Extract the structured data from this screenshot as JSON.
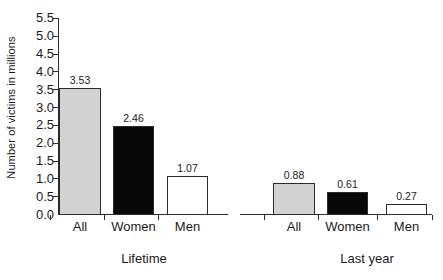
{
  "chart_data": {
    "type": "bar",
    "title": "",
    "subtitle": "",
    "xlabel": "",
    "ylabel": "Number of victims in millions",
    "ylim": [
      0.0,
      5.5
    ],
    "yticks": [
      "0.0",
      "0.5",
      "1.0",
      "1.5",
      "2.0",
      "2.5",
      "3.0",
      "3.5",
      "4.0",
      "4.5",
      "5.0",
      "5.5"
    ],
    "ytick_values": [
      0.0,
      0.5,
      1.0,
      1.5,
      2.0,
      2.5,
      3.0,
      3.5,
      4.0,
      4.5,
      5.0,
      5.5
    ],
    "grid": false,
    "legend": "none",
    "groups": [
      {
        "name": "Lifetime",
        "categories": [
          "All",
          "Women",
          "Men"
        ],
        "values": [
          3.53,
          2.46,
          1.07
        ],
        "labels": [
          "3.53",
          "2.46",
          "1.07"
        ],
        "fills": [
          "gray",
          "black",
          "white"
        ]
      },
      {
        "name": "Last year",
        "categories": [
          "All",
          "Women",
          "Men"
        ],
        "values": [
          0.88,
          0.61,
          0.27
        ],
        "labels": [
          "0.88",
          "0.61",
          "0.27"
        ],
        "fills": [
          "gray",
          "black",
          "white"
        ]
      }
    ],
    "categories": [
      "All",
      "Women",
      "Men",
      "All",
      "Women",
      "Men"
    ],
    "values": [
      3.53,
      2.46,
      1.07,
      0.88,
      0.61,
      0.27
    ],
    "series": [
      {
        "name": "Number of victims in millions",
        "values": [
          3.53,
          2.46,
          1.07,
          0.88,
          0.61,
          0.27
        ]
      }
    ],
    "colors": {
      "all": "#d2d2d2",
      "women": "#080808",
      "men": "#ffffff",
      "axis": "#2b2b2b",
      "text": "#1a1a1a"
    }
  },
  "layout": {
    "plot_left": 58,
    "plot_baseline": 214,
    "plot_top": 18,
    "axis_right": 432,
    "axis_gap_start": 228,
    "axis_gap_end": 240,
    "unit_px": 35.64,
    "bars": [
      {
        "x": 59,
        "w": 42,
        "group": 0,
        "index": 0
      },
      {
        "x": 113,
        "w": 41,
        "group": 0,
        "index": 1
      },
      {
        "x": 167,
        "w": 41,
        "group": 0,
        "index": 2
      },
      {
        "x": 273,
        "w": 42,
        "group": 1,
        "index": 0
      },
      {
        "x": 327,
        "w": 41,
        "group": 1,
        "index": 1
      },
      {
        "x": 386,
        "w": 41,
        "group": 1,
        "index": 2
      }
    ],
    "group_label_x": [
      144,
      367
    ],
    "group_label_y": 252,
    "cat_label_y": 220
  }
}
